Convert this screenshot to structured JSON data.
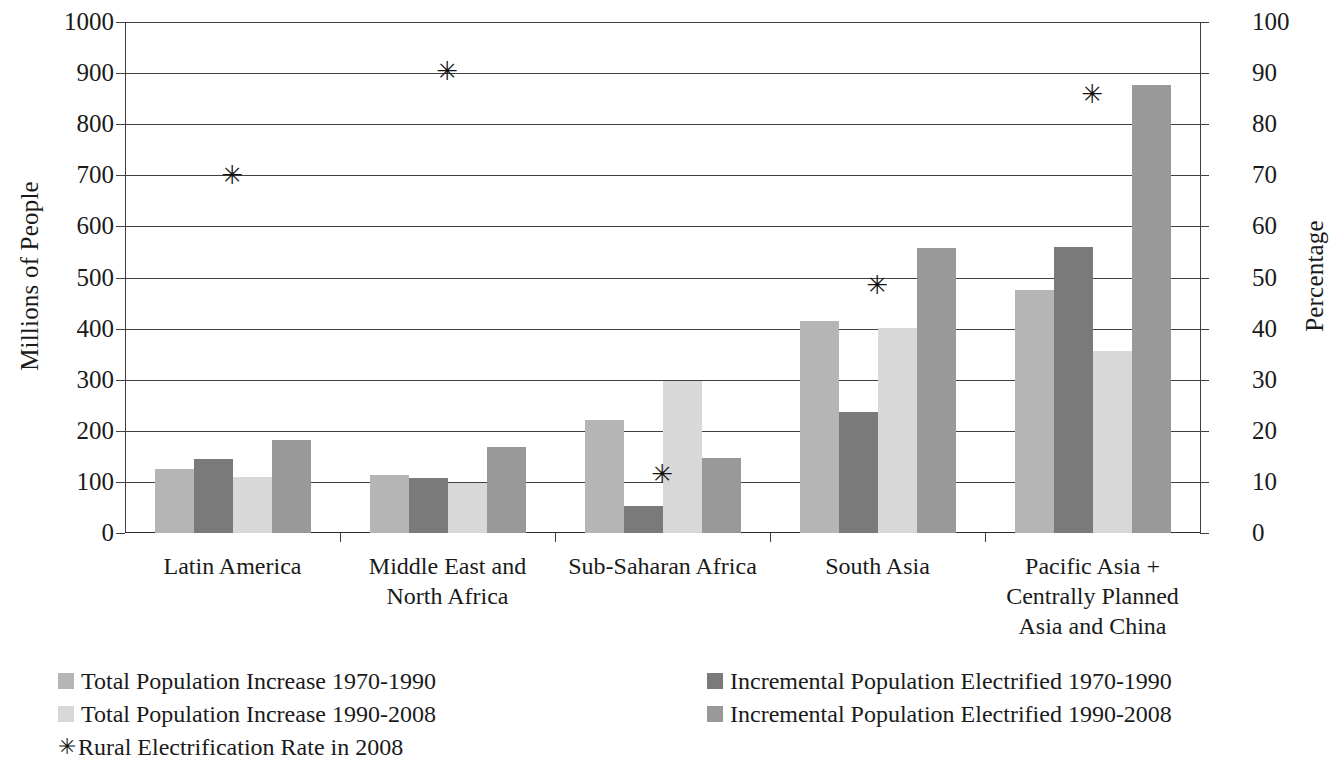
{
  "chart_data": {
    "type": "bar",
    "title": "",
    "subtitle": "",
    "xlabel": "",
    "ylabel": "Millions of People",
    "y2label": "Percentage",
    "ylim": [
      0,
      1000
    ],
    "y2lim": [
      0,
      100
    ],
    "yticks": [
      "0",
      "100",
      "200",
      "300",
      "400",
      "500",
      "600",
      "700",
      "800",
      "900",
      "1000"
    ],
    "y2ticks": [
      "0",
      "10",
      "20",
      "30",
      "40",
      "50",
      "60",
      "70",
      "80",
      "90",
      "100"
    ],
    "grid": true,
    "legend_position": "bottom",
    "categories": [
      "Latin America",
      "Middle East and North Africa",
      "Sub-Saharan Africa",
      "South Asia",
      "Pacific Asia + Centrally Planned Asia and China"
    ],
    "category_lines": [
      [
        "Latin America"
      ],
      [
        "Middle East and",
        "North Africa"
      ],
      [
        "Sub-Saharan Africa"
      ],
      [
        "South Asia"
      ],
      [
        "Pacific Asia +",
        "Centrally Planned",
        "Asia and China"
      ]
    ],
    "series": [
      {
        "name": "Total Population Increase 1970-1990",
        "color": "#b5b5b5",
        "axis": "left",
        "values": [
          125,
          113,
          222,
          414,
          476
        ]
      },
      {
        "name": "Incremental Population Electrified 1970-1990",
        "color": "#7a7a7a",
        "axis": "left",
        "values": [
          145,
          108,
          52,
          236,
          560
        ]
      },
      {
        "name": "Total Population Increase 1990-2008",
        "color": "#d8d8d8",
        "axis": "left",
        "values": [
          110,
          97,
          297,
          402,
          357
        ]
      },
      {
        "name": "Incremental Population Electrified 1990-2008",
        "color": "#999999",
        "axis": "left",
        "values": [
          183,
          168,
          147,
          558,
          877
        ]
      }
    ],
    "marker_series": {
      "name": "Rural Electrification Rate in 2008",
      "symbol": "✳",
      "color": "#111111",
      "axis": "right",
      "values": [
        70,
        90.5,
        11.5,
        48.5,
        86
      ]
    }
  },
  "legend": {
    "left_column": [
      {
        "label": "Total Population Increase 1970-1990",
        "swatch": "#b5b5b5",
        "kind": "swatch"
      },
      {
        "label": "Total Population Increase 1990-2008",
        "swatch": "#d8d8d8",
        "kind": "swatch"
      },
      {
        "label": "Rural Electrification Rate in 2008",
        "swatch": "#111111",
        "kind": "marker",
        "symbol": "✳"
      }
    ],
    "right_column": [
      {
        "label": "Incremental Population Electrified 1970-1990",
        "swatch": "#7a7a7a",
        "kind": "swatch"
      },
      {
        "label": "Incremental Population Electrified 1990-2008",
        "swatch": "#999999",
        "kind": "swatch"
      }
    ]
  }
}
